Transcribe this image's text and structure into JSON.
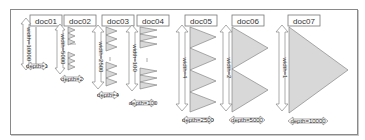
{
  "figure": {
    "docs": [
      {
        "id": "doc01",
        "width_label": "width=10000",
        "depth_label": "depth=1"
      },
      {
        "id": "doc02",
        "width_label": "width=5000",
        "depth_label": "depth=2"
      },
      {
        "id": "doc03",
        "width_label": "width=2500",
        "depth_label": "depth=4"
      },
      {
        "id": "doc04",
        "width_label": "width=100",
        "depth_label": "depth=100"
      },
      {
        "id": "doc05",
        "width_label": "width=4",
        "depth_label": "depth=2500"
      },
      {
        "id": "doc06",
        "width_label": "width=2",
        "depth_label": "depth=5000"
      },
      {
        "id": "doc07",
        "width_label": "width=1",
        "depth_label": "depth=10000"
      }
    ],
    "ellipsis": "—",
    "colors": {
      "triangle_fill": "#d8d8d8",
      "stroke": "#777777",
      "frame_border": "#8a8a8a",
      "text": "#333333"
    }
  }
}
